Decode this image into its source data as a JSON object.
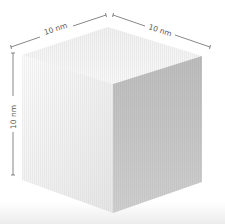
{
  "figure": {
    "dimensions": {
      "top_left_edge": "10 nm",
      "top_right_edge": "10 nm",
      "left_height": "10 nm"
    }
  },
  "colors": {
    "background": "#ffffff",
    "top_face": "#f3f3f3",
    "left_face": "#f7f7f7",
    "right_face": "#c8c8c8",
    "dimension_line": "#555555",
    "floor_shadow": "#ebebeb"
  }
}
